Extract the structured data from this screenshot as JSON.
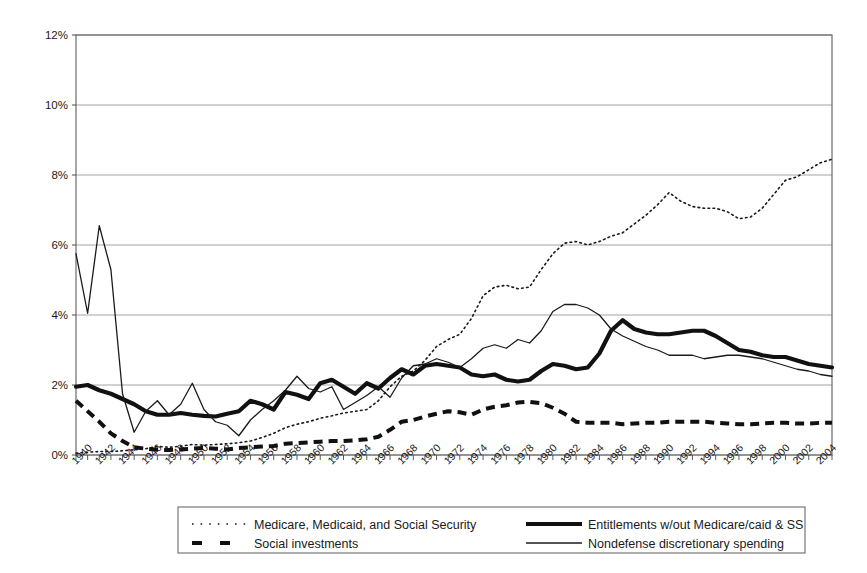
{
  "chart_data": {
    "type": "line",
    "title": "",
    "subtitle": "",
    "xlabel": "",
    "ylabel": "",
    "grid": true,
    "legend_position": "bottom",
    "xlim": [
      1940,
      2005
    ],
    "ylim": [
      0,
      12
    ],
    "ytick_labels": [
      "0%",
      "2%",
      "4%",
      "6%",
      "8%",
      "10%",
      "12%"
    ],
    "ytick_values": [
      0,
      2,
      4,
      6,
      8,
      10,
      12
    ],
    "xtick_labels": [
      "1940",
      "1942",
      "1944",
      "1946",
      "1948",
      "1950",
      "1952",
      "1954",
      "1956",
      "1958",
      "1960",
      "1962",
      "1964",
      "1966",
      "1968",
      "1970",
      "1972",
      "1974",
      "1976",
      "1978",
      "1980",
      "1982",
      "1984",
      "1986",
      "1988",
      "1990",
      "1992",
      "1994",
      "1996",
      "1998",
      "2000",
      "2002",
      "2004"
    ],
    "x": [
      1940,
      1941,
      1942,
      1943,
      1944,
      1945,
      1946,
      1947,
      1948,
      1949,
      1950,
      1951,
      1952,
      1953,
      1954,
      1955,
      1956,
      1957,
      1958,
      1959,
      1960,
      1961,
      1962,
      1963,
      1964,
      1965,
      1966,
      1967,
      1968,
      1969,
      1970,
      1971,
      1972,
      1973,
      1974,
      1975,
      1976,
      1977,
      1978,
      1979,
      1980,
      1981,
      1982,
      1983,
      1984,
      1985,
      1986,
      1987,
      1988,
      1989,
      1990,
      1991,
      1992,
      1993,
      1994,
      1995,
      1996,
      1997,
      1998,
      1999,
      2000,
      2001,
      2002,
      2003,
      2004,
      2005
    ],
    "series": [
      {
        "name": "Medicare, Medicaid, and Social Security",
        "style": "dotted",
        "color": "#1a1a1a",
        "width": 1.6,
        "values": [
          0.05,
          0.08,
          0.1,
          0.1,
          0.12,
          0.15,
          0.18,
          0.25,
          0.22,
          0.25,
          0.3,
          0.28,
          0.3,
          0.32,
          0.35,
          0.4,
          0.5,
          0.62,
          0.78,
          0.88,
          0.95,
          1.05,
          1.12,
          1.2,
          1.25,
          1.3,
          1.55,
          1.95,
          2.25,
          2.4,
          2.7,
          3.1,
          3.3,
          3.45,
          3.9,
          4.55,
          4.8,
          4.85,
          4.75,
          4.8,
          5.3,
          5.75,
          6.05,
          6.1,
          6.0,
          6.1,
          6.25,
          6.35,
          6.6,
          6.85,
          7.15,
          7.5,
          7.25,
          7.1,
          7.05,
          7.05,
          6.95,
          6.75,
          6.8,
          7.05,
          7.45,
          7.85,
          7.95,
          8.15,
          8.35,
          8.45
        ]
      },
      {
        "name": "Entitlements w/out Medicare/caid & SS",
        "style": "thick-solid",
        "color": "#111111",
        "width": 4.2,
        "values": [
          1.95,
          2.0,
          1.85,
          1.75,
          1.6,
          1.45,
          1.25,
          1.15,
          1.15,
          1.2,
          1.15,
          1.12,
          1.1,
          1.18,
          1.25,
          1.55,
          1.45,
          1.3,
          1.8,
          1.72,
          1.6,
          2.05,
          2.15,
          1.95,
          1.75,
          2.05,
          1.9,
          2.2,
          2.45,
          2.3,
          2.55,
          2.6,
          2.55,
          2.5,
          2.3,
          2.25,
          2.3,
          2.15,
          2.1,
          2.15,
          2.4,
          2.6,
          2.55,
          2.45,
          2.5,
          2.9,
          3.55,
          3.85,
          3.6,
          3.5,
          3.45,
          3.45,
          3.5,
          3.55,
          3.55,
          3.4,
          3.2,
          3.0,
          2.95,
          2.85,
          2.8,
          2.8,
          2.7,
          2.6,
          2.55,
          2.5
        ]
      },
      {
        "name": "Social investments",
        "style": "dashed",
        "color": "#111111",
        "width": 4.0,
        "values": [
          1.55,
          1.25,
          0.95,
          0.62,
          0.4,
          0.22,
          0.18,
          0.15,
          0.14,
          0.16,
          0.18,
          0.2,
          0.18,
          0.16,
          0.2,
          0.22,
          0.24,
          0.26,
          0.32,
          0.34,
          0.36,
          0.38,
          0.4,
          0.4,
          0.42,
          0.45,
          0.52,
          0.72,
          0.95,
          1.0,
          1.1,
          1.18,
          1.25,
          1.22,
          1.15,
          1.3,
          1.38,
          1.42,
          1.5,
          1.52,
          1.48,
          1.35,
          1.18,
          0.95,
          0.92,
          0.92,
          0.92,
          0.88,
          0.9,
          0.92,
          0.92,
          0.95,
          0.95,
          0.95,
          0.95,
          0.92,
          0.9,
          0.88,
          0.88,
          0.9,
          0.92,
          0.92,
          0.9,
          0.9,
          0.92,
          0.92
        ]
      },
      {
        "name": "Nondefense discretionary spending",
        "style": "thin-solid",
        "color": "#1a1a1a",
        "width": 1.3,
        "values": [
          5.75,
          4.05,
          6.55,
          5.3,
          1.75,
          0.65,
          1.25,
          1.55,
          1.15,
          1.45,
          2.05,
          1.3,
          0.95,
          0.85,
          0.55,
          1.0,
          1.3,
          1.55,
          1.85,
          2.25,
          1.9,
          1.8,
          1.95,
          1.3,
          1.5,
          1.7,
          1.95,
          1.65,
          2.2,
          2.55,
          2.6,
          2.75,
          2.65,
          2.5,
          2.75,
          3.05,
          3.15,
          3.05,
          3.3,
          3.2,
          3.55,
          4.1,
          4.3,
          4.3,
          4.2,
          4.0,
          3.6,
          3.4,
          3.25,
          3.1,
          3.0,
          2.85,
          2.85,
          2.85,
          2.75,
          2.8,
          2.85,
          2.85,
          2.8,
          2.75,
          2.65,
          2.55,
          2.45,
          2.4,
          2.3,
          2.25
        ]
      }
    ],
    "legend": [
      {
        "label": "Medicare, Medicaid, and Social Security",
        "style": "dotted"
      },
      {
        "label": "Entitlements w/out Medicare/caid & SS",
        "style": "thick-solid"
      },
      {
        "label": "Social investments",
        "style": "dashed"
      },
      {
        "label": "Nondefense discretionary spending",
        "style": "thin-solid"
      }
    ]
  }
}
